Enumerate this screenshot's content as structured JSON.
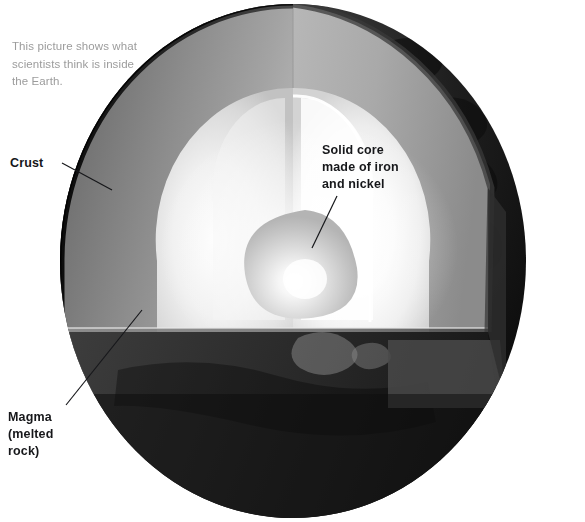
{
  "figure": {
    "background_color": "#ffffff",
    "caption": {
      "lines": [
        "This picture shows what",
        "scientists think is inside",
        "the Earth."
      ],
      "color": "#9c9c9c"
    },
    "labels": [
      {
        "id": "crust",
        "lines": [
          "Crust"
        ],
        "color": "#16171a",
        "bold": true,
        "leader_line": {
          "from_x": 62,
          "from_y": 163,
          "to_x": 112,
          "to_y": 190
        }
      },
      {
        "id": "magma",
        "lines": [
          "Magma",
          "(melted",
          "rock)"
        ],
        "color": "#16171a",
        "bold": true,
        "leader_line": {
          "from_x": 66,
          "from_y": 405,
          "to_x": 142,
          "to_y": 310
        }
      },
      {
        "id": "solid-core",
        "lines": [
          "Solid core",
          "made of iron",
          "and nickel"
        ],
        "color": "#16171a",
        "bold": true,
        "leader_line": {
          "from_x": 337,
          "from_y": 196,
          "to_x": 312,
          "to_y": 248
        }
      }
    ],
    "layers": [
      {
        "name": "crust",
        "description": "thin dark outer shell",
        "color": "#1d1d1d"
      },
      {
        "name": "mantle",
        "description": "grey cut face (magma / melted rock)",
        "color": "#767676"
      },
      {
        "name": "outer-core",
        "description": "bright glowing layer",
        "color": "#f2f2f2"
      },
      {
        "name": "inner-core",
        "description": "solid core made of iron and nickel",
        "color": "#d8d8d8"
      }
    ],
    "surface": {
      "name": "earth-surface",
      "description": "dark photographic globe surface with continents",
      "color": "#232323"
    },
    "geometry": {
      "sphere_left": 58,
      "sphere_top": 2,
      "sphere_width": 470,
      "sphere_height": 518,
      "cut_plane_y": 326,
      "wedge_seam_x": 292
    }
  }
}
